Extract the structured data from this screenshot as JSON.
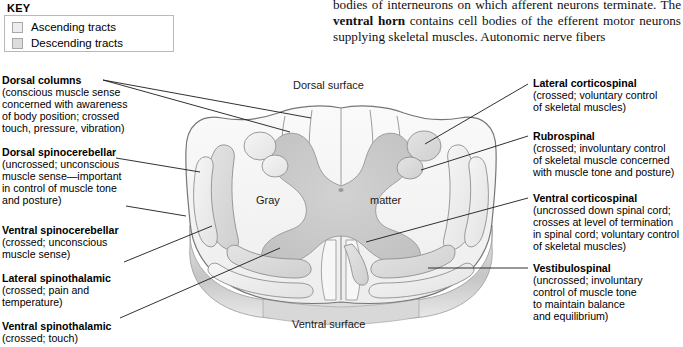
{
  "key": {
    "title": "KEY",
    "items": [
      {
        "label": "Ascending tracts",
        "color": "#ededed"
      },
      {
        "label": "Descending tracts",
        "color": "#dcdcdc"
      }
    ]
  },
  "body_text": {
    "line1": "bodies of interneurons on which afferent neurons terminate.",
    "line2_pre": "The ",
    "line2_bold": "ventral horn",
    "line2_post": " contains cell bodies of the efferent motor",
    "line3": "neurons supplying skeletal muscles. Autonomic nerve fibers"
  },
  "diagram": {
    "dorsal_surface": "Dorsal surface",
    "ventral_surface": "Ventral surface",
    "gray_left": "Gray",
    "gray_right": "matter",
    "colors": {
      "outline": "#6e6e6e",
      "white_matter": "#f4f4f4",
      "gray_matter": "#c9c9c9",
      "tract_light": "#efefef",
      "tract_mid": "#dadada",
      "bevel": "#cfcfcf",
      "leader": "#1a1a1a"
    }
  },
  "labels_left": [
    {
      "head": "Dorsal columns",
      "desc": [
        "(conscious muscle sense",
        "concerned with awareness",
        "of body position; crossed",
        "touch, pressure, vibration)"
      ]
    },
    {
      "head": "Dorsal spinocerebellar",
      "desc": [
        "(uncrossed; unconscious",
        "muscle sense—important",
        "in control of muscle tone",
        "and posture)"
      ]
    },
    {
      "head": "Ventral spinocerebellar",
      "desc": [
        "(crossed; unconscious",
        "muscle sense)"
      ]
    },
    {
      "head": "Lateral spinothalamic",
      "desc": [
        "(crossed; pain and",
        "temperature)"
      ]
    },
    {
      "head": "Ventral spinothalamic",
      "desc": [
        "(crossed; touch)"
      ]
    }
  ],
  "labels_right": [
    {
      "head": "Lateral corticospinal",
      "desc": [
        "(crossed; voluntary control",
        "of skeletal muscles)"
      ]
    },
    {
      "head": "Rubrospinal",
      "desc": [
        "(crossed; involuntary control",
        "of skeletal muscle concerned",
        "with muscle tone and posture)"
      ]
    },
    {
      "head": "Ventral corticospinal",
      "desc": [
        "(uncrossed down spinal cord;",
        "crosses at level of termination",
        "in spinal cord; voluntary control",
        "of skeletal muscles)"
      ]
    },
    {
      "head": "Vestibulospinal",
      "desc": [
        "(uncrossed; involuntary",
        "control of muscle tone",
        "to maintain balance",
        "and equilibrium)"
      ]
    }
  ]
}
